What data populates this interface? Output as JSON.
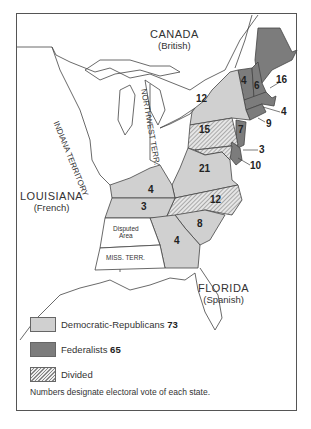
{
  "map": {
    "regions": {
      "canada": {
        "name": "CANADA",
        "sub": "(British)"
      },
      "louisiana": {
        "name": "LOUISIANA",
        "sub": "(French)"
      },
      "florida": {
        "name": "FLORIDA",
        "sub": "(Spanish)"
      },
      "indiana": {
        "name": "INDIANA TERRITORY"
      },
      "northwest": {
        "name": "NORTHWEST TERR."
      },
      "disputed": {
        "name1": "Disputed",
        "name2": "Area"
      },
      "miss": {
        "name": "MISS. TERR."
      }
    },
    "states": [
      {
        "id": "vt",
        "votes": "4",
        "party": "federalist"
      },
      {
        "id": "nh",
        "votes": "6",
        "party": "federalist"
      },
      {
        "id": "ma",
        "votes": "16",
        "party": "federalist"
      },
      {
        "id": "ri",
        "votes": "4",
        "party": "federalist"
      },
      {
        "id": "ct",
        "votes": "9",
        "party": "federalist"
      },
      {
        "id": "ny",
        "votes": "12",
        "party": "democratic-republican"
      },
      {
        "id": "nj",
        "votes": "7",
        "party": "federalist"
      },
      {
        "id": "pa",
        "votes": "15",
        "party": "divided"
      },
      {
        "id": "de",
        "votes": "3",
        "party": "federalist"
      },
      {
        "id": "md",
        "votes": "10",
        "party": "divided"
      },
      {
        "id": "va",
        "votes": "21",
        "party": "democratic-republican"
      },
      {
        "id": "ky",
        "votes": "4",
        "party": "democratic-republican"
      },
      {
        "id": "tn",
        "votes": "3",
        "party": "democratic-republican"
      },
      {
        "id": "nc",
        "votes": "12",
        "party": "divided"
      },
      {
        "id": "sc",
        "votes": "8",
        "party": "democratic-republican"
      },
      {
        "id": "ga",
        "votes": "4",
        "party": "democratic-republican"
      }
    ],
    "colors": {
      "democratic_republican": "#d0d0d0",
      "federalist": "#7c7c7c",
      "divided_hatch": "#888888",
      "outline": "#444444"
    }
  },
  "legend": {
    "items": [
      {
        "label": "Democratic-Republicans",
        "value": "73"
      },
      {
        "label": "Federalists",
        "value": "65"
      },
      {
        "label": "Divided",
        "value": ""
      }
    ],
    "note": "Numbers designate electoral vote of each state."
  }
}
